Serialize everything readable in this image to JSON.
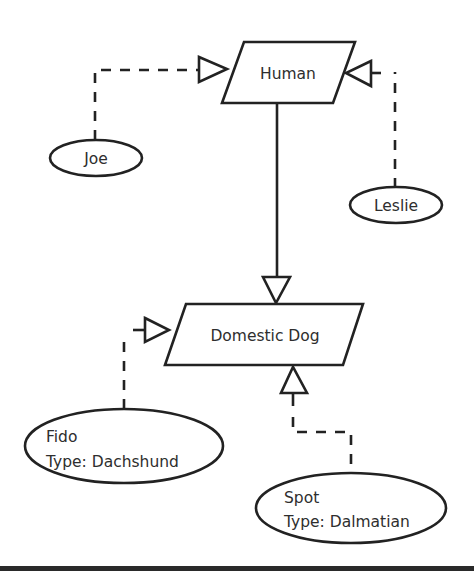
{
  "diagram": {
    "type": "uml-class-instance",
    "classes": [
      {
        "id": "human",
        "label": "Human"
      },
      {
        "id": "domestic-dog",
        "label": "Domestic Dog"
      }
    ],
    "instances": [
      {
        "id": "joe",
        "name": "Joe",
        "of": "human"
      },
      {
        "id": "leslie",
        "name": "Leslie",
        "of": "human"
      },
      {
        "id": "fido",
        "name": "Fido",
        "type_line": "Type: Dachshund",
        "of": "domestic-dog"
      },
      {
        "id": "spot",
        "name": "Spot",
        "type_line": "Type: Dalmatian",
        "of": "domestic-dog"
      }
    ],
    "edges": [
      {
        "from": "joe",
        "to": "human",
        "style": "dashed",
        "head": "hollow-triangle"
      },
      {
        "from": "leslie",
        "to": "human",
        "style": "dashed",
        "head": "hollow-triangle"
      },
      {
        "from": "human",
        "to": "domestic-dog",
        "style": "solid",
        "head": "hollow-triangle"
      },
      {
        "from": "fido",
        "to": "domestic-dog",
        "style": "dashed",
        "head": "hollow-triangle"
      },
      {
        "from": "spot",
        "to": "domestic-dog",
        "style": "dashed",
        "head": "hollow-triangle"
      }
    ],
    "colors": {
      "stroke": "#222222",
      "text": "#2e2e2e",
      "background": "#ffffff"
    }
  }
}
